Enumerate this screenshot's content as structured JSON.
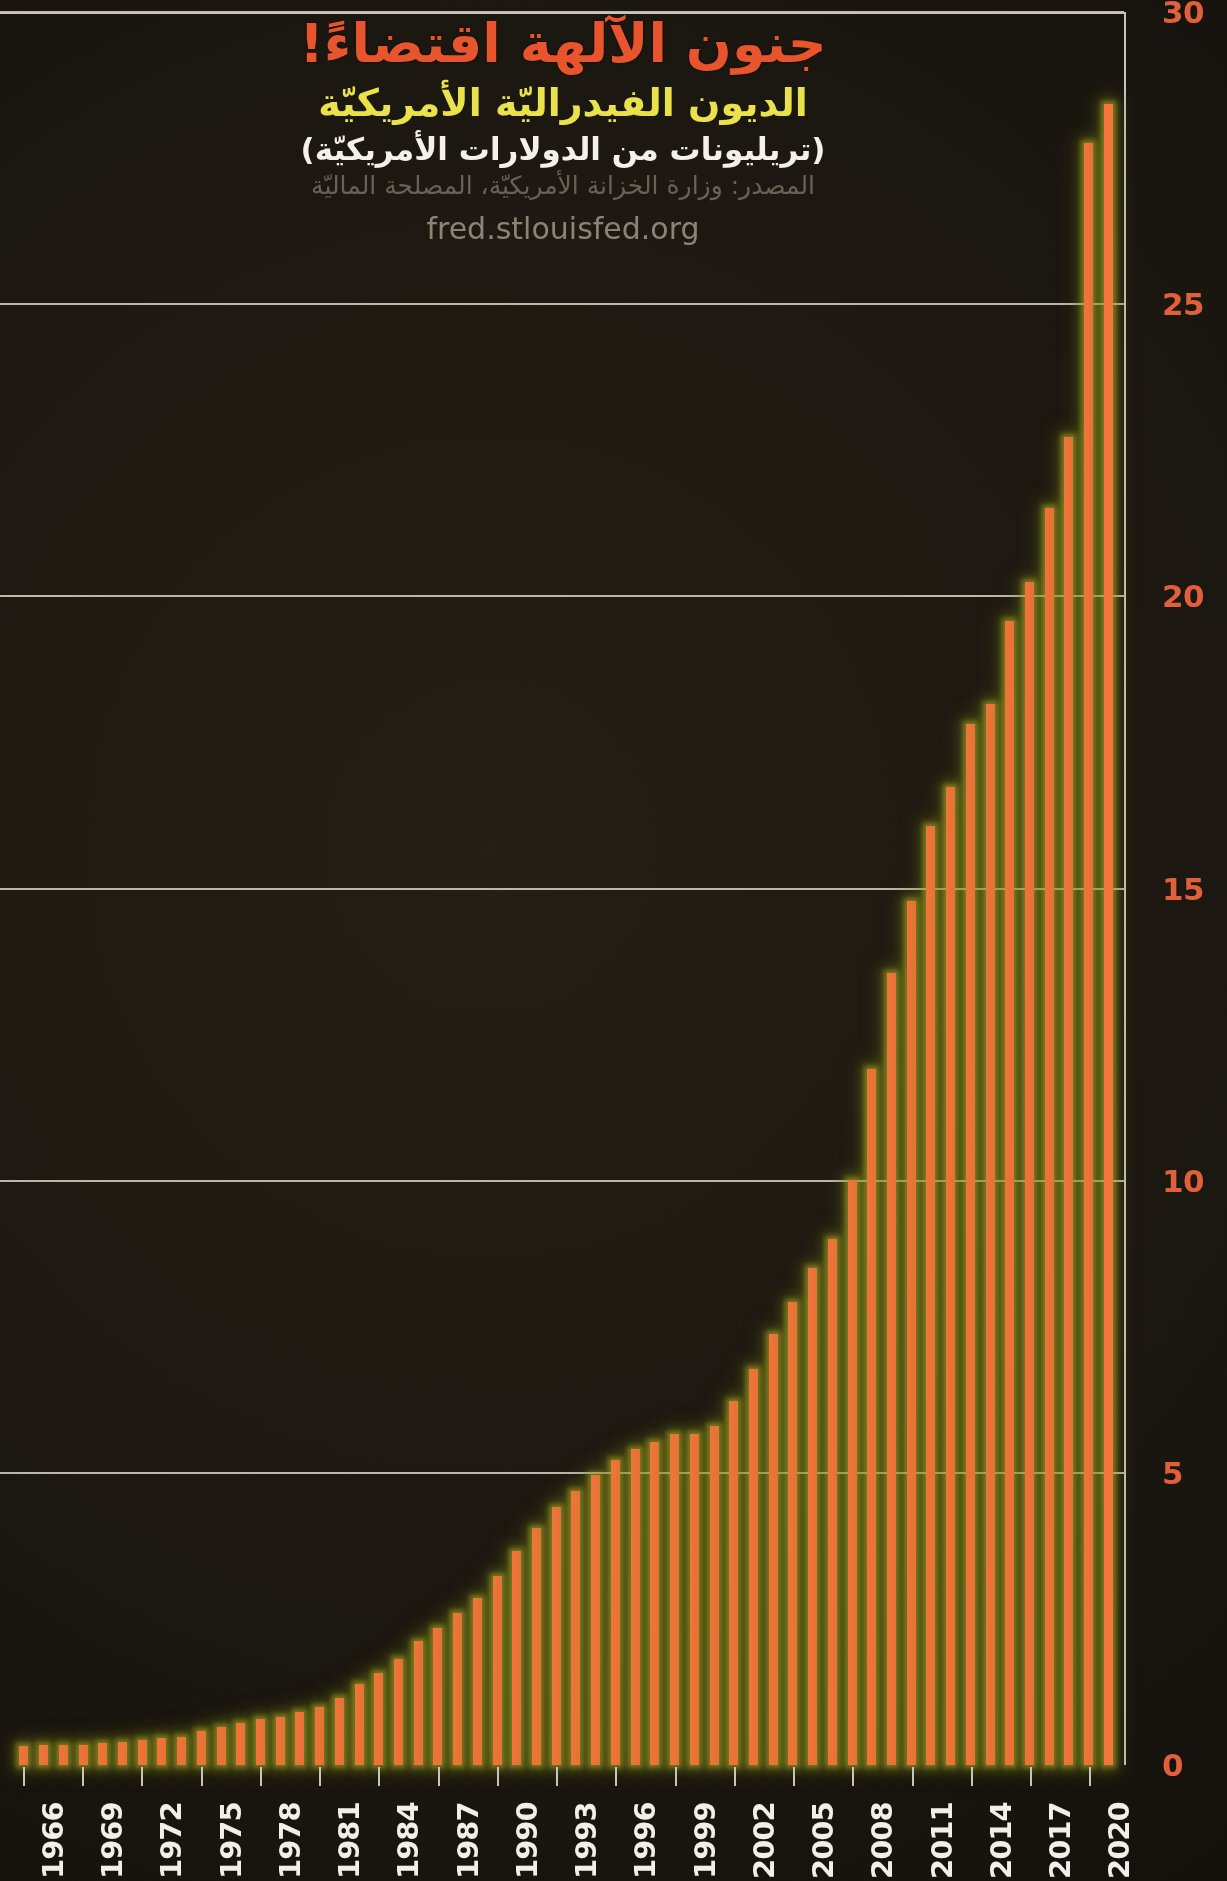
{
  "title": "جنون الآلهة اقتضاءً!",
  "subtitle": "الديون الفيدراليّة الأمريكيّة",
  "units": "(تريليونات من الدولارات الأمريكيّة)",
  "source": "المصدر: وزارة الخزانة الأمريكيّة، المصلحة الماليّة",
  "url": "fred.stlouisfed.org",
  "colors": {
    "bar": "#f4743b",
    "glow": "#9a9b28",
    "title": "#e8552c",
    "subtitle": "#eae24a",
    "units": "#f4f1ea",
    "source": "#6a6053",
    "url": "#8d8274",
    "ylabel": "#e0603a",
    "xlabel": "#f2efe8",
    "grid": "#c9c4bb",
    "background": "#17130d"
  },
  "chart_data": {
    "type": "bar",
    "title": "جنون الآلهة اقتضاءً!",
    "subtitle": "الديون الفيدراليّة الأمريكيّة",
    "xlabel": "",
    "ylabel": "(تريليونات من الدولارات الأمريكيّة)",
    "ylim": [
      0,
      30
    ],
    "yticks": [
      0,
      5,
      10,
      15,
      20,
      25,
      30
    ],
    "ytick_labels": [
      "0",
      "5",
      "10",
      "15",
      "20",
      "25",
      "30"
    ],
    "grid": true,
    "legend": "none",
    "xtick_labels": [
      "1966",
      "1969",
      "1972",
      "1975",
      "1978",
      "1981",
      "1984",
      "1987",
      "1990",
      "1993",
      "1996",
      "1999",
      "2002",
      "2005",
      "2008",
      "2011",
      "2014",
      "2017",
      "2020"
    ],
    "xtick_step": 3,
    "categories": [
      "1966",
      "1967",
      "1968",
      "1969",
      "1970",
      "1971",
      "1972",
      "1973",
      "1974",
      "1975",
      "1976",
      "1977",
      "1978",
      "1979",
      "1980",
      "1981",
      "1982",
      "1983",
      "1984",
      "1985",
      "1986",
      "1987",
      "1988",
      "1989",
      "1990",
      "1991",
      "1992",
      "1993",
      "1994",
      "1995",
      "1996",
      "1997",
      "1998",
      "1999",
      "2000",
      "2001",
      "2002",
      "2003",
      "2004",
      "2005",
      "2006",
      "2007",
      "2008",
      "2009",
      "2010",
      "2011",
      "2012",
      "2013",
      "2014",
      "2015",
      "2016",
      "2017",
      "2018",
      "2019",
      "2020",
      "2021"
    ],
    "values": [
      0.32,
      0.34,
      0.35,
      0.35,
      0.37,
      0.4,
      0.43,
      0.46,
      0.48,
      0.58,
      0.65,
      0.72,
      0.78,
      0.83,
      0.91,
      1.0,
      1.14,
      1.38,
      1.57,
      1.82,
      2.13,
      2.35,
      2.6,
      2.86,
      3.23,
      3.67,
      4.06,
      4.41,
      4.69,
      4.97,
      5.22,
      5.41,
      5.53,
      5.66,
      5.67,
      5.81,
      6.23,
      6.78,
      7.38,
      7.93,
      8.51,
      9.01,
      10.02,
      11.91,
      13.56,
      14.79,
      16.07,
      16.74,
      17.82,
      18.15,
      19.57,
      20.24,
      21.52,
      22.72,
      27.75,
      28.43
    ],
    "series_name": "Federal Debt (Trillions USD)"
  }
}
